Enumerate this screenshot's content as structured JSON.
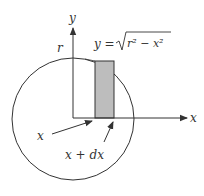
{
  "diagram": {
    "colors": {
      "stroke": "#333333",
      "strip_fill": "#bdbdbd",
      "background": "#ffffff"
    },
    "axes": {
      "x_label": "x",
      "y_label": "y"
    },
    "circle": {
      "radius_label": "r"
    },
    "strip": {
      "equation_lhs": "y = ",
      "equation_radicand": "r² − x²",
      "left_label": "x",
      "right_label": "x + dx"
    }
  }
}
